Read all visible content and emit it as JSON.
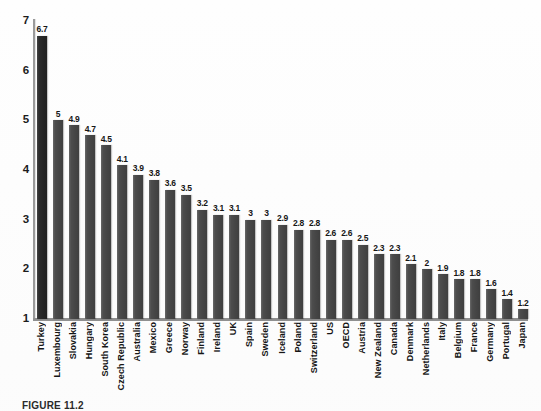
{
  "chart_data": {
    "type": "bar",
    "title": "",
    "xlabel": "",
    "ylabel": "",
    "ylim": [
      1,
      7
    ],
    "yticks": [
      1,
      2,
      3,
      4,
      5,
      6,
      7
    ],
    "grid": false,
    "legend": "none",
    "highlight_category": "Turkey",
    "categories": [
      "Turkey",
      "Luxembourg",
      "Slovakia",
      "Hungary",
      "South Korea",
      "Czech Republic",
      "Australia",
      "Mexico",
      "Greece",
      "Norway",
      "Finland",
      "Ireland",
      "UK",
      "Spain",
      "Sweden",
      "Iceland",
      "Poland",
      "Switzerland",
      "US",
      "OECD",
      "Austria",
      "New Zealand",
      "Canada",
      "Denmark",
      "Netherlands",
      "Italy",
      "Belgium",
      "France",
      "Germany",
      "Portugal",
      "Japan"
    ],
    "values": [
      6.7,
      5,
      4.9,
      4.7,
      4.5,
      4.1,
      3.9,
      3.8,
      3.6,
      3.5,
      3.2,
      3.1,
      3.1,
      3,
      3,
      2.9,
      2.8,
      2.8,
      2.6,
      2.6,
      2.5,
      2.3,
      2.3,
      2.1,
      2,
      1.9,
      1.8,
      1.8,
      1.6,
      1.4,
      1.2
    ],
    "value_labels": [
      "6.7",
      "5",
      "4.9",
      "4.7",
      "4.5",
      "4.1",
      "3.9",
      "3.8",
      "3.6",
      "3.5",
      "3.2",
      "3.1",
      "3.1",
      "3",
      "3",
      "2.9",
      "2.8",
      "2.8",
      "2.6",
      "2.6",
      "2.5",
      "2.3",
      "2.3",
      "2.1",
      "2",
      "1.9",
      "1.8",
      "1.8",
      "1.6",
      "1.4",
      "1.2"
    ],
    "colors": {
      "bar": "#4d4d4d",
      "bar_highlight": "#2c2c2c",
      "axis": "#8f8f8f",
      "text": "#161616",
      "background": "#fefefe"
    }
  },
  "caption": {
    "text": "FIGURE 11.2"
  }
}
